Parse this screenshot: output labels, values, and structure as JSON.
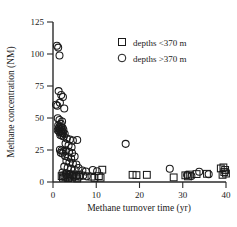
{
  "chart_data": {
    "type": "scatter",
    "title": "",
    "xlabel": "Methane turnover time (yr)",
    "ylabel": "Methane concentration (NM)",
    "xlim": [
      0,
      40
    ],
    "ylim": [
      0,
      125
    ],
    "xticks": [
      "0",
      "10",
      "20",
      "30",
      "40"
    ],
    "xtick_values": [
      0,
      10,
      20,
      30,
      40
    ],
    "yticks": [
      "0",
      "25",
      "50",
      "75",
      "100",
      "125"
    ],
    "ytick_values": [
      0,
      25,
      50,
      75,
      100,
      125
    ],
    "grid": false,
    "legend_position": "top-right",
    "series": [
      {
        "name": "depths <370 m",
        "marker": "square",
        "points": [
          [
            2.0,
            4.6
          ],
          [
            2.3,
            3.4
          ],
          [
            2.6,
            5.2
          ],
          [
            2.9,
            4.0
          ],
          [
            3.2,
            5.8
          ],
          [
            3.5,
            3.0
          ],
          [
            3.8,
            4.4
          ],
          [
            4.1,
            6.0
          ],
          [
            4.4,
            3.6
          ],
          [
            4.8,
            5.0
          ],
          [
            5.2,
            4.2
          ],
          [
            5.6,
            2.8
          ],
          [
            6.0,
            5.4
          ],
          [
            8.9,
            4.2
          ],
          [
            9.6,
            3.2
          ],
          [
            10.6,
            4.6
          ],
          [
            11.0,
            3.4
          ],
          [
            11.4,
            9.6
          ],
          [
            18.4,
            5.6
          ],
          [
            19.3,
            5.4
          ],
          [
            21.7,
            5.6
          ],
          [
            27.9,
            3.6
          ],
          [
            30.6,
            5.2
          ],
          [
            31.2,
            4.4
          ],
          [
            31.6,
            5.8
          ],
          [
            33.2,
            6.2
          ],
          [
            35.6,
            6.4
          ],
          [
            38.8,
            10.6
          ],
          [
            39.4,
            11.4
          ],
          [
            39.6,
            7.8
          ],
          [
            39.8,
            9.4
          ],
          [
            40.0,
            6.6
          ],
          [
            39.2,
            5.6
          ]
        ]
      },
      {
        "name": "depths >370 m",
        "marker": "circle",
        "points": [
          [
            0.9,
            106.5
          ],
          [
            1.2,
            105.0
          ],
          [
            1.5,
            98.8
          ],
          [
            1.3,
            71.0
          ],
          [
            1.9,
            68.0
          ],
          [
            2.3,
            66.4
          ],
          [
            1.6,
            62.0
          ],
          [
            0.7,
            60.4
          ],
          [
            1.0,
            59.6
          ],
          [
            2.6,
            57.4
          ],
          [
            1.1,
            49.8
          ],
          [
            1.5,
            48.4
          ],
          [
            2.1,
            47.2
          ],
          [
            1.8,
            45.4
          ],
          [
            1.2,
            44.2
          ],
          [
            1.5,
            43.4
          ],
          [
            1.9,
            43.0
          ],
          [
            2.2,
            42.4
          ],
          [
            1.3,
            41.8
          ],
          [
            1.6,
            41.4
          ],
          [
            2.0,
            41.0
          ],
          [
            2.4,
            40.8
          ],
          [
            1.1,
            40.4
          ],
          [
            1.4,
            40.0
          ],
          [
            1.8,
            39.6
          ],
          [
            2.2,
            39.4
          ],
          [
            1.5,
            38.8
          ],
          [
            1.9,
            38.4
          ],
          [
            2.3,
            38.0
          ],
          [
            2.7,
            37.6
          ],
          [
            1.7,
            36.8
          ],
          [
            2.1,
            36.2
          ],
          [
            2.5,
            35.6
          ],
          [
            3.2,
            34.0
          ],
          [
            3.9,
            33.2
          ],
          [
            4.6,
            32.4
          ],
          [
            5.6,
            32.8
          ],
          [
            2.9,
            30.0
          ],
          [
            3.6,
            28.6
          ],
          [
            4.3,
            27.2
          ],
          [
            1.6,
            25.2
          ],
          [
            2.0,
            24.6
          ],
          [
            2.4,
            23.8
          ],
          [
            1.8,
            22.8
          ],
          [
            2.2,
            22.2
          ],
          [
            3.0,
            24.4
          ],
          [
            3.7,
            23.6
          ],
          [
            4.4,
            22.6
          ],
          [
            2.8,
            20.4
          ],
          [
            3.5,
            19.6
          ],
          [
            4.2,
            18.4
          ],
          [
            5.0,
            20.0
          ],
          [
            3.1,
            16.4
          ],
          [
            3.8,
            15.2
          ],
          [
            4.6,
            14.4
          ],
          [
            5.4,
            13.6
          ],
          [
            2.6,
            12.0
          ],
          [
            3.4,
            11.2
          ],
          [
            4.2,
            10.4
          ],
          [
            5.0,
            9.6
          ],
          [
            5.9,
            11.0
          ],
          [
            6.8,
            9.0
          ],
          [
            7.6,
            8.2
          ],
          [
            2.2,
            7.4
          ],
          [
            3.0,
            6.6
          ],
          [
            3.8,
            6.0
          ],
          [
            4.6,
            5.4
          ],
          [
            5.4,
            4.8
          ],
          [
            6.2,
            4.2
          ],
          [
            7.0,
            5.0
          ],
          [
            7.8,
            4.4
          ],
          [
            9.2,
            9.4
          ],
          [
            10.2,
            8.4
          ],
          [
            16.8,
            29.8
          ],
          [
            27.0,
            10.4
          ],
          [
            31.0,
            5.4
          ],
          [
            32.0,
            4.6
          ],
          [
            33.8,
            8.0
          ],
          [
            36.0,
            6.0
          ]
        ]
      }
    ]
  },
  "legend": {
    "entries": [
      {
        "label": "depths <370 m",
        "marker": "square-marker"
      },
      {
        "label": "depths >370 m",
        "marker": "circle-marker"
      }
    ]
  },
  "colors": {
    "marker_stroke": "#1a1a1a",
    "axis": "#2b2b2b",
    "background": "#ffffff"
  }
}
